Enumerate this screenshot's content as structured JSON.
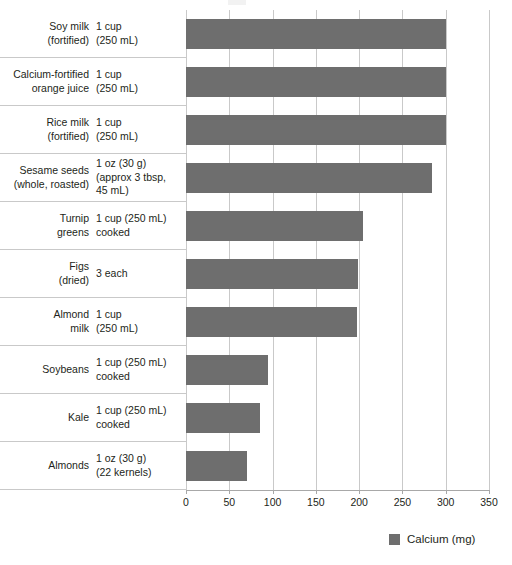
{
  "chart_data": {
    "type": "bar",
    "orientation": "horizontal",
    "title": "",
    "xlabel": "",
    "ylabel": "",
    "xlim": [
      0,
      350
    ],
    "xticks": [
      0,
      50,
      100,
      150,
      200,
      250,
      300,
      350
    ],
    "xtick_labels": [
      "0",
      "50",
      "100",
      "150",
      "200",
      "250",
      "300",
      "350"
    ],
    "grid": true,
    "grid_axis": "x",
    "legend": {
      "position": "bottom-right",
      "entries": [
        {
          "label": "Calcium (mg)",
          "color": "#6e6e6e"
        }
      ]
    },
    "series": [
      {
        "name": "Calcium (mg)",
        "color": "#6e6e6e",
        "values": [
          300,
          300,
          300,
          284,
          204,
          199,
          197,
          95,
          85,
          70
        ]
      }
    ],
    "categories": [
      "Soy milk (fortified)",
      "Calcium-fortified orange juice",
      "Rice milk (fortified)",
      "Sesame seeds (whole, roasted)",
      "Turnip greens",
      "Figs (dried)",
      "Almond milk",
      "Soybeans",
      "Kale",
      "Almonds"
    ],
    "rows": [
      {
        "food": "Soy milk\n(fortified)",
        "serving": "1 cup\n(250 mL)",
        "value": 300
      },
      {
        "food": "Calcium-fortified\norange juice",
        "serving": "1 cup\n(250 mL)",
        "value": 300
      },
      {
        "food": "Rice milk\n(fortified)",
        "serving": "1 cup\n(250 mL)",
        "value": 300
      },
      {
        "food": "Sesame seeds\n(whole, roasted)",
        "serving": "1 oz (30 g)\n(approx 3 tbsp,\n45 mL)",
        "value": 284
      },
      {
        "food": "Turnip\ngreens",
        "serving": "1 cup (250 mL)\ncooked",
        "value": 204
      },
      {
        "food": "Figs\n(dried)",
        "serving": "3 each",
        "value": 199
      },
      {
        "food": "Almond\nmilk",
        "serving": "1 cup\n(250 mL)",
        "value": 197
      },
      {
        "food": "Soybeans",
        "serving": "1 cup (250 mL)\ncooked",
        "value": 95
      },
      {
        "food": "Kale",
        "serving": "1 cup (250 mL)\ncooked",
        "value": 85
      },
      {
        "food": "Almonds",
        "serving": "1 oz (30 g)\n(22 kernels)",
        "value": 70
      }
    ]
  },
  "legend": {
    "swatch_icon": "legend-color-swatch",
    "label": "Calcium (mg)"
  },
  "colors": {
    "bar": "#6e6e6e",
    "gridline": "#c9c9c9",
    "axis": "#a8a8a8",
    "text": "#231f20",
    "background": "#ffffff"
  }
}
